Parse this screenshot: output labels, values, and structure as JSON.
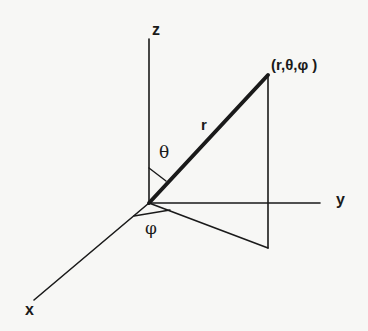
{
  "diagram": {
    "labels": {
      "z_axis": "z",
      "y_axis": "y",
      "x_axis": "x",
      "radius": "r",
      "theta": "θ",
      "phi": "φ",
      "point": "(r,θ,φ )"
    },
    "colors": {
      "ink": "#1a1a1a",
      "paper": "#f7f7f5"
    }
  }
}
